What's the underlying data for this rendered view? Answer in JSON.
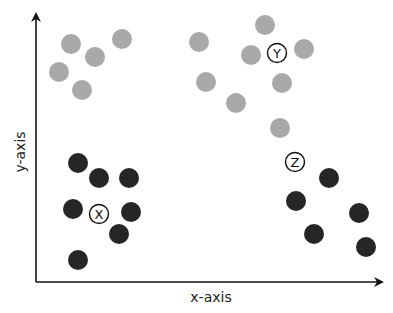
{
  "diagram": {
    "type": "scatter-clusters",
    "x_axis_label": "x-axis",
    "y_axis_label": "y-axis",
    "colors": {
      "light_cluster": "#a9a9a9",
      "dark_cluster": "#262626",
      "axis": "#111111",
      "background": "#ffffff"
    },
    "clusters": [
      {
        "label": "Y",
        "color": "light",
        "centroid": [
          277,
          53
        ],
        "points": [
          [
            71,
            44
          ],
          [
            122,
            39
          ],
          [
            95,
            57
          ],
          [
            59,
            72
          ],
          [
            82,
            90
          ],
          [
            265,
            25
          ],
          [
            199,
            42
          ],
          [
            251,
            55
          ],
          [
            304,
            49
          ],
          [
            206,
            82
          ],
          [
            282,
            83
          ],
          [
            236,
            103
          ],
          [
            280,
            128
          ]
        ]
      },
      {
        "label": "X",
        "color": "dark",
        "centroid": [
          99,
          214
        ],
        "points": [
          [
            78,
            163
          ],
          [
            99,
            178
          ],
          [
            129,
            178
          ],
          [
            73,
            209
          ],
          [
            131,
            212
          ],
          [
            119,
            234
          ],
          [
            78,
            260
          ]
        ]
      },
      {
        "label": "Z",
        "color": "dark",
        "centroid": [
          295,
          162
        ],
        "points": [
          [
            329,
            178
          ],
          [
            296,
            201
          ],
          [
            359,
            213
          ],
          [
            314,
            234
          ],
          [
            366,
            247
          ]
        ]
      }
    ]
  },
  "chart_data": {
    "type": "scatter",
    "title": "",
    "xlabel": "x-axis",
    "ylabel": "y-axis",
    "grid": false,
    "legend": null,
    "series": [
      {
        "name": "Y (light grey)",
        "points": [
          [
            71,
            44
          ],
          [
            122,
            39
          ],
          [
            95,
            57
          ],
          [
            59,
            72
          ],
          [
            82,
            90
          ],
          [
            265,
            25
          ],
          [
            199,
            42
          ],
          [
            251,
            55
          ],
          [
            304,
            49
          ],
          [
            206,
            82
          ],
          [
            282,
            83
          ],
          [
            236,
            103
          ],
          [
            280,
            128
          ]
        ]
      },
      {
        "name": "X (dark)",
        "points": [
          [
            78,
            163
          ],
          [
            99,
            178
          ],
          [
            129,
            178
          ],
          [
            73,
            209
          ],
          [
            131,
            212
          ],
          [
            119,
            234
          ],
          [
            78,
            260
          ]
        ]
      },
      {
        "name": "Z (dark)",
        "points": [
          [
            329,
            178
          ],
          [
            296,
            201
          ],
          [
            359,
            213
          ],
          [
            314,
            234
          ],
          [
            366,
            247
          ]
        ]
      }
    ],
    "annotations": [
      {
        "text": "X",
        "at": [
          99,
          214
        ]
      },
      {
        "text": "Y",
        "at": [
          277,
          53
        ]
      },
      {
        "text": "Z",
        "at": [
          295,
          162
        ]
      }
    ]
  }
}
